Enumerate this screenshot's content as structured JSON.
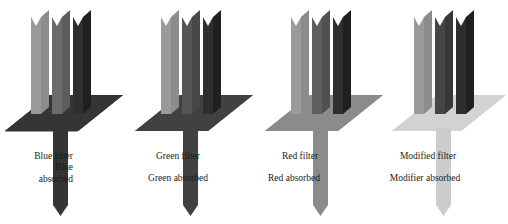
{
  "figure": {
    "background": "#ffffff",
    "width": 508,
    "height": 224,
    "blade_count_per_unit": 3,
    "blade_colors": [
      "#9a9a9a",
      "#6b6b6b",
      "#3a3a3a"
    ],
    "blade_label_meaning": [
      "light grey blade",
      "medium grey blade",
      "dark grey blade"
    ]
  },
  "units": [
    {
      "id": "blue-filter",
      "labels": [
        "Blue filter",
        "Blue",
        "absorbed"
      ],
      "label_align": "right",
      "plate_color": "#353535",
      "stem_color": "#353535",
      "blades": [
        "#9a9a9a",
        "#6b6b6b",
        "#2e2e2e"
      ],
      "origin_x": 10
    },
    {
      "id": "green-filter",
      "labels": [
        "Green filter",
        "Green absorbed"
      ],
      "label_align": "center",
      "plate_color": "#414141",
      "stem_color": "#414141",
      "blades": [
        "#9a9a9a",
        "#555555",
        "#2e2e2e"
      ],
      "origin_x": 136
    },
    {
      "id": "red-filter",
      "labels": [
        "Red filter",
        "Red absorbed"
      ],
      "label_align": "center",
      "plate_color": "#8b8b8b",
      "stem_color": "#8b8b8b",
      "blades": [
        "#9a9a9a",
        "#5e5e5e",
        "#2e2e2e"
      ],
      "origin_x": 262
    },
    {
      "id": "modified-filter",
      "labels": [
        "Modified filter",
        "Modifier absorbed"
      ],
      "label_align": "center",
      "plate_color": "#d2d2d2",
      "stem_color": "#cccccc",
      "blades": [
        "#9a9a9a",
        "#454545",
        "#2e2e2e"
      ],
      "origin_x": 388
    }
  ],
  "captions": {
    "blue_line1": "Blue filter",
    "blue_line2": "Blue",
    "blue_line3": "absorbed",
    "green_line1": "Green filter",
    "green_line2": "Green absorbed",
    "red_line1": "Red filter",
    "red_line2": "Red absorbed",
    "modified_line1": "Modified filter",
    "modified_line2": "Modifier absorbed"
  }
}
